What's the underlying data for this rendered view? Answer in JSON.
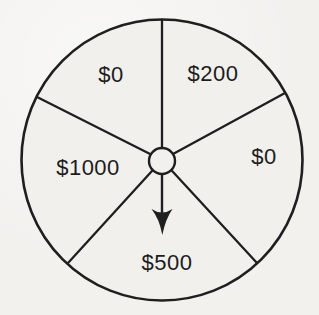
{
  "wheel": {
    "description": "Spinner wheel divided into five prize sectors with a center hub and an arrow pointer pointing down",
    "background_color": "#f2f1ee",
    "line_color": "#1f1f1f",
    "text_color": "#1c1c1c",
    "sectors": [
      {
        "position": "top-right",
        "label": "$200"
      },
      {
        "position": "right",
        "label": "$0"
      },
      {
        "position": "bottom",
        "label": "$500"
      },
      {
        "position": "left",
        "label": "$1000"
      },
      {
        "position": "top-left",
        "label": "$0"
      }
    ],
    "pointer": {
      "direction": "down",
      "points_at_sector": "$500"
    }
  }
}
